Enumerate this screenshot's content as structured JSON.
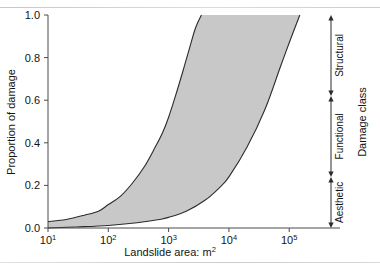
{
  "figure": {
    "background_color": "#ffffff",
    "band_fill_color": "#c8c8c8",
    "line_color": "#2b2b2b",
    "axis_color": "#4a4a4a"
  },
  "chart_data": {
    "type": "area",
    "title": "",
    "subtitle": "",
    "xlabel": "Landslide area: m",
    "xlabel_exponent": "2",
    "ylabel": "Proportion of damage",
    "x_scale": "log",
    "xlim": [
      10,
      300000
    ],
    "ylim": [
      0,
      1.0
    ],
    "grid": false,
    "legend": "none",
    "x_tick_labels": [
      "10",
      "10",
      "10",
      "10",
      "10"
    ],
    "x_tick_exponents": [
      "1",
      "2",
      "3",
      "4",
      "5"
    ],
    "x_tick_values": [
      10,
      100,
      1000,
      10000,
      100000
    ],
    "y_tick_labels": [
      "0.0",
      "0.2",
      "0.4",
      "0.6",
      "0.8",
      "1.0"
    ],
    "y_tick_values": [
      0.0,
      0.2,
      0.4,
      0.6,
      0.8,
      1.0
    ],
    "series": [
      {
        "name": "Upper bound of damage proportion",
        "x": [
          10,
          20,
          40,
          70,
          100,
          160,
          250,
          400,
          600,
          800,
          1000,
          1300,
          1700,
          2200,
          2800,
          3500
        ],
        "values": [
          0.03,
          0.04,
          0.06,
          0.08,
          0.11,
          0.15,
          0.21,
          0.29,
          0.38,
          0.45,
          0.52,
          0.62,
          0.73,
          0.84,
          0.94,
          1.0
        ]
      },
      {
        "name": "Lower bound of damage proportion",
        "x": [
          10,
          30,
          100,
          300,
          700,
          1000,
          2000,
          4000,
          7000,
          10000,
          20000,
          40000,
          70000,
          100000,
          150000
        ],
        "values": [
          0.0,
          0.005,
          0.012,
          0.025,
          0.04,
          0.05,
          0.08,
          0.13,
          0.19,
          0.24,
          0.38,
          0.56,
          0.75,
          0.87,
          1.0
        ]
      }
    ],
    "annotations": {
      "group_label": "Damage class",
      "classes": [
        {
          "label": "Structural",
          "range": [
            0.62,
            1.0
          ]
        },
        {
          "label": "Functional",
          "range": [
            0.24,
            0.62
          ]
        },
        {
          "label": "Aesthetic",
          "range": [
            0.0,
            0.24
          ]
        }
      ]
    }
  }
}
